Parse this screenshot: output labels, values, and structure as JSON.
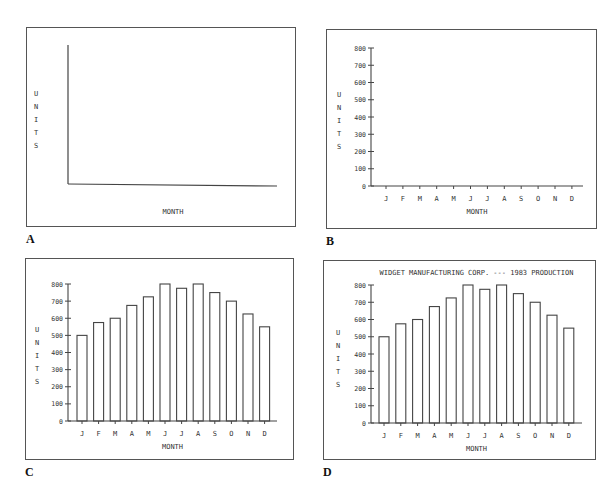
{
  "panels": [
    {
      "letter": "A",
      "frame": {
        "x": 26,
        "y": 27,
        "w": 270,
        "h": 200
      }
    },
    {
      "letter": "B",
      "frame": {
        "x": 326,
        "y": 29,
        "w": 271,
        "h": 200
      }
    },
    {
      "letter": "C",
      "frame": {
        "x": 25,
        "y": 258,
        "w": 269,
        "h": 202
      }
    },
    {
      "letter": "D",
      "frame": {
        "x": 323,
        "y": 260,
        "w": 273,
        "h": 200
      }
    }
  ],
  "chart_data": [
    {
      "panel": "A",
      "type": "bar",
      "title": "",
      "xlabel": "MONTH",
      "ylabel": "UNITS",
      "categories": [],
      "values": [],
      "axes_only": true,
      "ticks": false,
      "grid": false,
      "legend": "none"
    },
    {
      "panel": "B",
      "type": "bar",
      "title": "",
      "xlabel": "MONTH",
      "ylabel": "UNITS",
      "categories": [
        "J",
        "F",
        "M",
        "A",
        "M",
        "J",
        "J",
        "A",
        "S",
        "O",
        "N",
        "D"
      ],
      "yticks": [
        0,
        100,
        200,
        300,
        400,
        500,
        600,
        700,
        800
      ],
      "ylim": [
        0,
        800
      ],
      "values": [],
      "grid": false,
      "legend": "none"
    },
    {
      "panel": "C",
      "type": "bar",
      "title": "",
      "xlabel": "MONTH",
      "ylabel": "UNITS",
      "categories": [
        "J",
        "F",
        "M",
        "A",
        "M",
        "J",
        "J",
        "A",
        "S",
        "O",
        "N",
        "D"
      ],
      "yticks": [
        0,
        100,
        200,
        300,
        400,
        500,
        600,
        700,
        800
      ],
      "ylim": [
        0,
        800
      ],
      "values": [
        500,
        575,
        600,
        675,
        725,
        800,
        775,
        800,
        750,
        700,
        625,
        550
      ],
      "grid": false,
      "legend": "none"
    },
    {
      "panel": "D",
      "type": "bar",
      "title": "WIDGET MANUFACTURING CORP. --- 1983 PRODUCTION",
      "xlabel": "MONTH",
      "ylabel": "UNITS",
      "categories": [
        "J",
        "F",
        "M",
        "A",
        "M",
        "J",
        "J",
        "A",
        "S",
        "O",
        "N",
        "D"
      ],
      "yticks": [
        0,
        100,
        200,
        300,
        400,
        500,
        600,
        700,
        800
      ],
      "ylim": [
        0,
        800
      ],
      "values": [
        500,
        575,
        600,
        675,
        725,
        800,
        775,
        800,
        750,
        700,
        625,
        550
      ],
      "grid": false,
      "legend": "none"
    }
  ]
}
